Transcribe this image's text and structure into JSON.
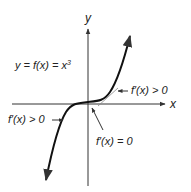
{
  "diagram": {
    "axes": {
      "x_label": "x",
      "y_label": "y"
    },
    "function_label": {
      "lhs": "y = f(x) = x",
      "exponent": "3"
    },
    "annotations": [
      {
        "id": "right",
        "text": "f′(x) > 0"
      },
      {
        "id": "left",
        "text": "f′(x) > 0"
      },
      {
        "id": "origin",
        "text": "f′(x) = 0"
      }
    ],
    "colors": {
      "axis": "#333333",
      "curve": "#111111",
      "tangent": "#777777",
      "text": "#222222"
    }
  }
}
